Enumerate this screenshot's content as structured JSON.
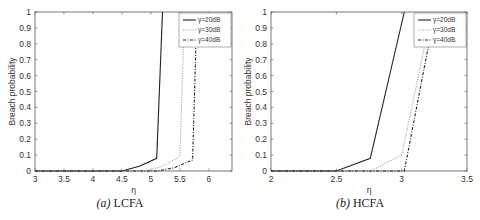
{
  "chart_data": [
    {
      "type": "line",
      "title": "",
      "caption_prefix": "(a)",
      "caption": "LCFA",
      "xlabel": "η",
      "ylabel": "Breach probability",
      "xlim": [
        3,
        6.4
      ],
      "ylim": [
        0,
        1
      ],
      "xticks": [
        3,
        3.5,
        4,
        4.5,
        5,
        5.5,
        6
      ],
      "yticks": [
        0,
        0.1,
        0.2,
        0.3,
        0.4,
        0.5,
        0.6,
        0.7,
        0.8,
        0.9,
        1
      ],
      "grid": false,
      "legend_position": "upper right",
      "series": [
        {
          "name": "γ=20dB",
          "style": "solid",
          "color": "#222222",
          "x": [
            3,
            4.5,
            4.8,
            5.1,
            5.2
          ],
          "y": [
            0,
            0,
            0.03,
            0.08,
            1
          ]
        },
        {
          "name": "γ=30dB",
          "style": "dotted",
          "color": "#aaaaaa",
          "x": [
            3,
            4.9,
            5.2,
            5.5,
            5.58
          ],
          "y": [
            0,
            0,
            0.03,
            0.09,
            1
          ]
        },
        {
          "name": "γ=40dB",
          "style": "dashdot",
          "color": "#222222",
          "x": [
            3,
            5.1,
            5.4,
            5.72,
            5.78
          ],
          "y": [
            0,
            0,
            0.02,
            0.07,
            0.83
          ]
        }
      ]
    },
    {
      "type": "line",
      "title": "",
      "caption_prefix": "(b)",
      "caption": "HCFA",
      "xlabel": "η",
      "ylabel": "Breach probability",
      "xlim": [
        2,
        3.5
      ],
      "ylim": [
        0,
        1
      ],
      "xticks": [
        2,
        2.5,
        3,
        3.5
      ],
      "yticks": [
        0,
        0.1,
        0.2,
        0.3,
        0.4,
        0.5,
        0.6,
        0.7,
        0.8,
        0.9,
        1
      ],
      "grid": false,
      "legend_position": "upper right",
      "series": [
        {
          "name": "γ=20dB",
          "style": "solid",
          "color": "#222222",
          "x": [
            2,
            2.5,
            2.76,
            3.02
          ],
          "y": [
            0,
            0,
            0.08,
            1
          ]
        },
        {
          "name": "γ=30dB",
          "style": "dotted",
          "color": "#aaaaaa",
          "x": [
            2,
            2.76,
            3.0,
            3.2
          ],
          "y": [
            0,
            0,
            0.1,
            0.88
          ]
        },
        {
          "name": "γ=40dB",
          "style": "dashdot",
          "color": "#222222",
          "x": [
            2,
            3.02,
            3.22
          ],
          "y": [
            0,
            0,
            0.85
          ]
        }
      ]
    }
  ]
}
